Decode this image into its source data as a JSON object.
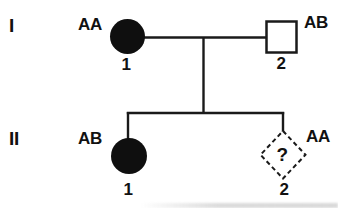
{
  "pedigree": {
    "generations": [
      {
        "label": "I"
      },
      {
        "label": "II"
      }
    ],
    "individuals": [
      {
        "id": "I-1",
        "generation": "I",
        "number": "1",
        "genotype": "AA",
        "symbol": "filled-circle",
        "meaning": "affected-female"
      },
      {
        "id": "I-2",
        "generation": "I",
        "number": "2",
        "genotype": "AB",
        "symbol": "open-square",
        "meaning": "unaffected-male"
      },
      {
        "id": "II-1",
        "generation": "II",
        "number": "1",
        "genotype": "AB",
        "symbol": "filled-circle",
        "meaning": "affected-female"
      },
      {
        "id": "II-2",
        "generation": "II",
        "number": "2",
        "genotype": "AA",
        "symbol": "dashed-diamond",
        "meaning": "unknown",
        "unknown_mark": "?"
      }
    ],
    "colors": {
      "symbol_fill": "#0f0f0f",
      "line": "#1a1a1a",
      "background": "#ffffff"
    }
  }
}
